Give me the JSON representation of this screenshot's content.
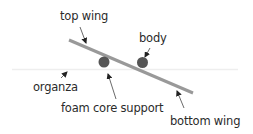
{
  "diagram": {
    "labels": {
      "top_wing": "top wing",
      "body": "body",
      "organza": "organza",
      "foam_core_support": "foam core support",
      "bottom_wing": "bottom wing"
    },
    "colors": {
      "wing": "#999999",
      "circle": "#555555",
      "organza_line": "#eeeeee",
      "arrow": "#333333",
      "text": "#2b2b2b"
    }
  }
}
